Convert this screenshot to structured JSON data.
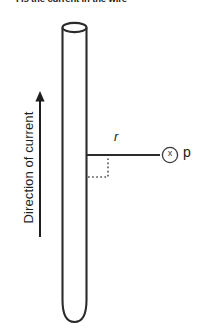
{
  "header": {
    "text": "I is the current in the wire"
  },
  "diagram": {
    "wire": {
      "name": "wire-cylinder",
      "description": "vertical cylindrical wire",
      "stroke_color": "#2b2b2b",
      "fill_color": "#ffffff"
    },
    "current_arrow": {
      "name": "current-direction-arrow",
      "label": "Direction of current",
      "direction": "up",
      "color": "#1f1f1f"
    },
    "radius_line": {
      "name": "radius-line",
      "label": "r",
      "color": "#2b2b2b"
    },
    "right_angle_marker": {
      "name": "right-angle-marker",
      "style": "dotted",
      "color": "#555555"
    },
    "field_point": {
      "name": "field-point-p",
      "label": "p",
      "symbol": "x",
      "symbol_meaning": "field-into-page",
      "color": "#3a3a3a"
    }
  },
  "colors": {
    "background": "#ffffff",
    "ink": "#1a1a1a",
    "outline": "#2b2b2b"
  }
}
